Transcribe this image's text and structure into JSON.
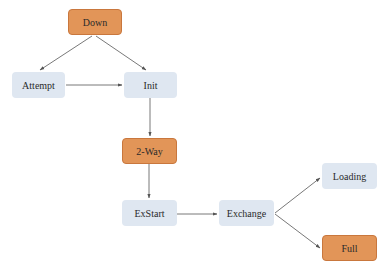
{
  "colors": {
    "light_node": "#dfe7f1",
    "highlight_node": "#e29558",
    "edge": "#555555"
  },
  "nodes": {
    "down": {
      "label": "Down",
      "style": "highlight"
    },
    "attempt": {
      "label": "Attempt",
      "style": "light"
    },
    "init": {
      "label": "Init",
      "style": "light"
    },
    "two_way": {
      "label": "2-Way",
      "style": "highlight"
    },
    "exstart": {
      "label": "ExStart",
      "style": "light"
    },
    "exchange": {
      "label": "Exchange",
      "style": "light"
    },
    "loading": {
      "label": "Loading",
      "style": "light"
    },
    "full": {
      "label": "Full",
      "style": "highlight"
    }
  },
  "edges": [
    {
      "from": "Down",
      "to": "Attempt"
    },
    {
      "from": "Down",
      "to": "Init"
    },
    {
      "from": "Attempt",
      "to": "Init"
    },
    {
      "from": "Init",
      "to": "2-Way"
    },
    {
      "from": "2-Way",
      "to": "ExStart"
    },
    {
      "from": "ExStart",
      "to": "Exchange"
    },
    {
      "from": "Exchange",
      "to": "Loading"
    },
    {
      "from": "Exchange",
      "to": "Full"
    }
  ]
}
